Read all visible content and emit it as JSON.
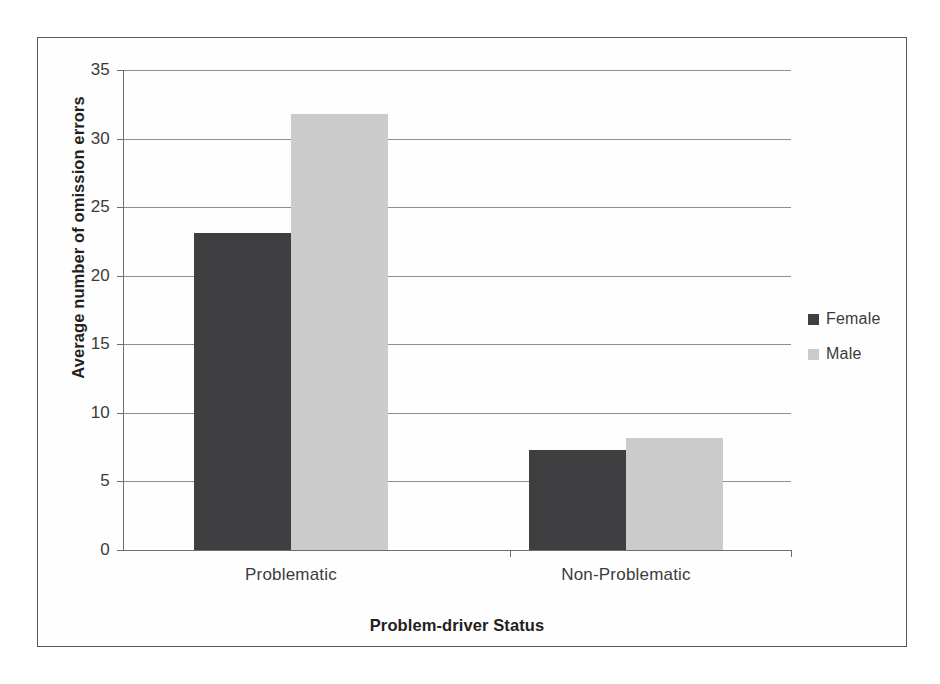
{
  "chart_data": {
    "type": "bar",
    "title": "",
    "xlabel": "Problem-driver Status",
    "ylabel": "Average number of omission errors",
    "categories": [
      "Problematic",
      "Non-Problematic"
    ],
    "series": [
      {
        "name": "Female",
        "color": "#3f3f42",
        "values": [
          23.1,
          7.3
        ]
      },
      {
        "name": "Male",
        "color": "#cbcbcb",
        "values": [
          31.8,
          8.2
        ]
      }
    ],
    "ylim": [
      0,
      35
    ],
    "ytick_labels": [
      "35",
      "30",
      "25",
      "20",
      "15",
      "10",
      "5",
      "0"
    ],
    "ytick_values": [
      35,
      30,
      25,
      20,
      15,
      10,
      5,
      0
    ],
    "ytick_step": 5,
    "grid": "horizontal",
    "legend_position": "right",
    "legend_entries": [
      "Female",
      "Male"
    ],
    "frame": "outer-border"
  },
  "axis": {
    "y_title": "Average number of omission errors",
    "x_title": "Problem-driver Status"
  },
  "legend": {
    "items": [
      {
        "label": "Female",
        "color": "#3f3f42"
      },
      {
        "label": "Male",
        "color": "#cbcbcb"
      }
    ]
  },
  "colors": {
    "female_bar": "#3f3f42",
    "male_bar": "#cbcbcb",
    "gridline": "#8d8e90",
    "axis": "#6d6e71",
    "frame": "#58595b",
    "text": "#3b3b3d"
  }
}
